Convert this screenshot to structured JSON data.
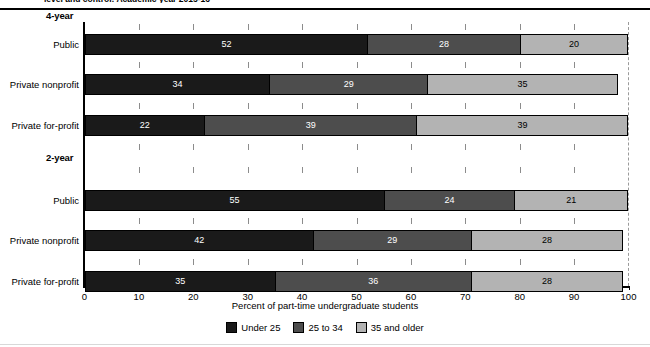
{
  "caption_clipped": "level and control: Academic year 2015-16",
  "chart_data": {
    "type": "bar",
    "orientation": "horizontal",
    "stacked": true,
    "title": "",
    "xlabel": "Percent of part-time undergraduate students",
    "ylabel": "",
    "xlim": [
      0,
      100
    ],
    "xticks": [
      0,
      10,
      20,
      30,
      40,
      50,
      60,
      70,
      80,
      90,
      100
    ],
    "xtick_labels": [
      "0",
      "10",
      "20",
      "30",
      "40",
      "50",
      "60",
      "70",
      "80",
      "90",
      "100"
    ],
    "grid": false,
    "legend_position": "bottom-center",
    "series": [
      {
        "name": "Under 25",
        "color": "#1a1a1a",
        "values": [
          52,
          34,
          22,
          55,
          42,
          35
        ]
      },
      {
        "name": "25 to 34",
        "color": "#4d4d4d",
        "values": [
          28,
          29,
          39,
          24,
          29,
          36
        ]
      },
      {
        "name": "35 and older",
        "color": "#b3b3b3",
        "values": [
          20,
          35,
          39,
          21,
          28,
          28
        ]
      }
    ],
    "categories": [
      "Public",
      "Private nonprofit",
      "Private for-profit",
      "Public",
      "Private nonprofit",
      "Private for-profit"
    ],
    "groups": [
      {
        "label": "4-year",
        "category_indices": [
          0,
          1,
          2
        ]
      },
      {
        "label": "2-year",
        "category_indices": [
          3,
          4,
          5
        ]
      }
    ]
  },
  "legend": {
    "items": [
      {
        "label": "Under 25",
        "swatch": "c0"
      },
      {
        "label": "25 to 34",
        "swatch": "c1"
      },
      {
        "label": "35 and older",
        "swatch": "c2"
      }
    ]
  }
}
